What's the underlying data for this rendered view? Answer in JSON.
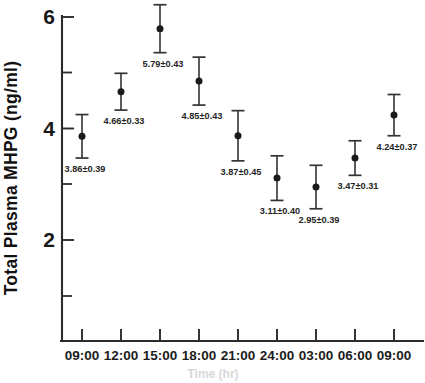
{
  "chart_data": {
    "type": "scatter",
    "title": "",
    "xlabel": "",
    "ylabel": "Total Plasma MHPG (ng/ml)",
    "x": [
      "09:00",
      "12:00",
      "15:00",
      "18:00",
      "21:00",
      "24:00",
      "03:00",
      "06:00",
      "09:00"
    ],
    "categories": [
      "09:00",
      "12:00",
      "15:00",
      "18:00",
      "21:00",
      "24:00",
      "03:00",
      "06:00",
      "09:00"
    ],
    "values": [
      3.86,
      4.66,
      5.79,
      4.85,
      3.87,
      3.11,
      2.95,
      3.47,
      4.24
    ],
    "errors": [
      0.39,
      0.33,
      0.43,
      0.43,
      0.45,
      0.4,
      0.39,
      0.31,
      0.37
    ],
    "point_labels": [
      "3.86±0.39",
      "4.66±0.33",
      "5.79±0.43",
      "4.85±0.43",
      "3.87±0.45",
      "3.11±0.40",
      "2.95±0.39",
      "3.47±0.31",
      "4.24±0.37"
    ],
    "ylim": [
      0.35,
      6.35
    ],
    "xlim": [
      0,
      10
    ],
    "yticks_major": [
      2,
      4,
      6
    ],
    "yticks_major_labels": [
      "2",
      "4",
      "6"
    ],
    "yticks_minor": [
      1,
      3,
      5
    ],
    "grid": false,
    "legend": null,
    "legend_position": "none",
    "error_notation": "mean±SEM",
    "marker": "filled-circle",
    "series": [
      {
        "name": "Total Plasma MHPG",
        "values": [
          3.86,
          4.66,
          5.79,
          4.85,
          3.87,
          3.11,
          2.95,
          3.47,
          4.24
        ],
        "errors": [
          0.39,
          0.33,
          0.43,
          0.43,
          0.45,
          0.4,
          0.39,
          0.31,
          0.37
        ]
      }
    ]
  },
  "axes": {
    "y_title": "Total Plasma MHPG (ng/ml)",
    "y_tick_labels": [
      "6",
      "4",
      "2"
    ],
    "x_tick_labels": [
      "09:00",
      "12:00",
      "15:00",
      "18:00",
      "21:00",
      "24:00",
      "03:00",
      "06:00",
      "09:00"
    ]
  },
  "colors": {
    "axis": "#2b2b2b",
    "marker": "#1a1a1a",
    "errorbar": "#333333",
    "text": "#191919",
    "background": "#ffffff"
  },
  "caption_ghost": "Time (hr)"
}
